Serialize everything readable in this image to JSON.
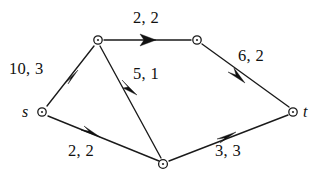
{
  "diagram": {
    "background_color": "#ffffff",
    "stroke_color": "#1a1a1a",
    "nodes": [
      {
        "id": "s",
        "label": "s",
        "x": 42,
        "y": 112,
        "label_x": 22,
        "label_y": 104
      },
      {
        "id": "v1",
        "label": "",
        "x": 98,
        "y": 40
      },
      {
        "id": "v2",
        "label": "",
        "x": 197,
        "y": 40
      },
      {
        "id": "v3",
        "label": "",
        "x": 163,
        "y": 164
      },
      {
        "id": "t",
        "label": "t",
        "x": 293,
        "y": 112,
        "label_x": 303,
        "label_y": 104
      }
    ],
    "edges": [
      {
        "id": "s-v1",
        "from": "s",
        "to": "v1",
        "label": "10, 3",
        "label_x": 9,
        "label_y": 61,
        "arrow_x": 72,
        "arrow_y": 77
      },
      {
        "id": "v1-v2",
        "from": "v1",
        "to": "v2",
        "label": "2, 2",
        "label_x": 133,
        "label_y": 10,
        "arrow_x": 150,
        "arrow_y": 40
      },
      {
        "id": "v1-v3",
        "from": "v1",
        "to": "v3",
        "label": "5, 1",
        "label_x": 133,
        "label_y": 66,
        "arrow_x": 133,
        "arrow_y": 88
      },
      {
        "id": "v2-t",
        "from": "v2",
        "to": "t",
        "label": "6, 2",
        "label_x": 238,
        "label_y": 48,
        "arrow_x": 239,
        "arrow_y": 79
      },
      {
        "id": "s-v3",
        "from": "s",
        "to": "v3",
        "label": "2, 2",
        "label_x": 68,
        "label_y": 143,
        "arrow_x": 93,
        "arrow_y": 133
      },
      {
        "id": "v3-t",
        "from": "v3",
        "to": "t",
        "label": "3, 3",
        "label_x": 215,
        "label_y": 143,
        "arrow_x": 229,
        "arrow_y": 135
      }
    ]
  }
}
